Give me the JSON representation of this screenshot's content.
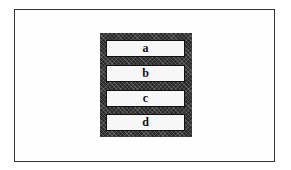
{
  "diagram": {
    "type": "stacked-boxes",
    "items": [
      {
        "label": "a"
      },
      {
        "label": "b"
      },
      {
        "label": "c"
      },
      {
        "label": "d"
      }
    ],
    "colors": {
      "container_fill": "#2a2a2a",
      "slot_fill": "#f7f7f7",
      "frame_border": "#333333"
    }
  }
}
